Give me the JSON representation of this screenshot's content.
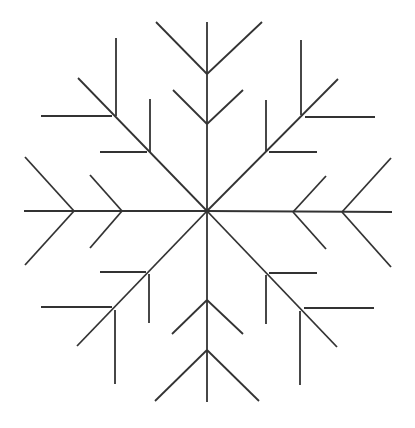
{
  "figure": {
    "title": "Snowflake line drawing",
    "width": 415,
    "height": 428,
    "background": "#ffffff",
    "stroke_color": "#333333",
    "stroke_width": 1.8,
    "center": [
      207,
      211
    ]
  },
  "snowflake": {
    "arms": [
      {
        "name": "top",
        "line": [
          207,
          211,
          207,
          22
        ],
        "branches": [
          [
            207,
            124,
            173,
            90
          ],
          [
            207,
            124,
            243,
            90
          ],
          [
            207,
            74,
            156,
            22
          ],
          [
            207,
            74,
            262,
            22
          ]
        ]
      },
      {
        "name": "bottom",
        "line": [
          207,
          211,
          207,
          402
        ],
        "branches": [
          [
            207,
            300,
            172,
            334
          ],
          [
            207,
            300,
            243,
            334
          ],
          [
            207,
            350,
            155,
            401
          ],
          [
            207,
            350,
            259,
            401
          ]
        ]
      },
      {
        "name": "left",
        "line": [
          207,
          211,
          24,
          211
        ],
        "branches": [
          [
            122,
            211,
            90,
            175
          ],
          [
            122,
            211,
            90,
            248
          ],
          [
            74,
            211,
            25,
            157
          ],
          [
            74,
            211,
            25,
            265
          ]
        ]
      },
      {
        "name": "right",
        "line": [
          207,
          211,
          392,
          212
        ],
        "branches": [
          [
            293,
            212,
            326,
            176
          ],
          [
            293,
            212,
            326,
            249
          ],
          [
            342,
            212,
            391,
            158
          ],
          [
            342,
            212,
            391,
            267
          ]
        ]
      },
      {
        "name": "upper-left",
        "line": [
          207,
          211,
          78,
          78
        ],
        "branches": [
          [
            150,
            152,
            150,
            99
          ],
          [
            147,
            152,
            100,
            152
          ],
          [
            116,
            116,
            116,
            38
          ],
          [
            112,
            116,
            41,
            116
          ]
        ]
      },
      {
        "name": "upper-right",
        "line": [
          207,
          211,
          338,
          79
        ],
        "branches": [
          [
            266,
            151,
            266,
            100
          ],
          [
            269,
            152,
            317,
            152
          ],
          [
            301,
            115,
            301,
            40
          ],
          [
            305,
            117,
            375,
            117
          ]
        ]
      },
      {
        "name": "lower-left",
        "line": [
          207,
          211,
          77,
          346
        ],
        "branches": [
          [
            149,
            274,
            149,
            323
          ],
          [
            146,
            272,
            100,
            272
          ],
          [
            115,
            310,
            115,
            384
          ],
          [
            112,
            307,
            41,
            307
          ]
        ]
      },
      {
        "name": "lower-right",
        "line": [
          207,
          211,
          337,
          347
        ],
        "branches": [
          [
            266,
            275,
            266,
            324
          ],
          [
            269,
            273,
            317,
            273
          ],
          [
            300,
            311,
            300,
            385
          ],
          [
            304,
            308,
            374,
            308
          ]
        ]
      }
    ]
  }
}
